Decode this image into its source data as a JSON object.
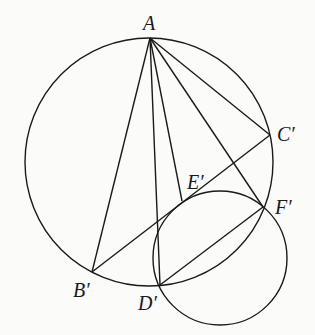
{
  "diagram": {
    "stroke_color": "#1a1a1a",
    "background": "#fbfbfa",
    "circles": [
      {
        "name": "circumcircle",
        "cx": 149,
        "cy": 162,
        "r": 124
      },
      {
        "name": "small-circle",
        "cx": 220,
        "cy": 258,
        "r": 67
      }
    ],
    "points": {
      "A": {
        "x": 150,
        "y": 38,
        "label": "A"
      },
      "B": {
        "x": 92,
        "y": 272,
        "label": "B′"
      },
      "C": {
        "x": 270,
        "y": 135,
        "label": "C′"
      },
      "D": {
        "x": 160,
        "y": 285,
        "label": "D′"
      },
      "E": {
        "x": 182,
        "y": 201,
        "label": "E′"
      },
      "F": {
        "x": 263,
        "y": 207,
        "label": "F′"
      }
    },
    "segments": [
      [
        "A",
        "B"
      ],
      [
        "A",
        "C"
      ],
      [
        "A",
        "D"
      ],
      [
        "A",
        "E"
      ],
      [
        "A",
        "F"
      ],
      [
        "B",
        "C"
      ],
      [
        "D",
        "F"
      ]
    ],
    "labels": {
      "A": "A",
      "B": "B′",
      "C": "C′",
      "D": "D′",
      "E": "E′",
      "F": "F′"
    }
  }
}
